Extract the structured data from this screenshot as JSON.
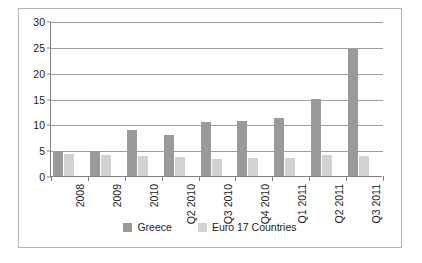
{
  "chart_data": {
    "type": "bar",
    "title": "",
    "xlabel": "",
    "ylabel": "",
    "ylim": [
      0,
      30
    ],
    "yticks": [
      0,
      5,
      10,
      15,
      20,
      25,
      30
    ],
    "grid": true,
    "legend_position": "bottom",
    "categories": [
      "2008",
      "2009",
      "2010",
      "Q2 2010",
      "Q3 2010",
      "Q4 2010",
      "Q1 2011",
      "Q2 2011",
      "Q3 2011"
    ],
    "series": [
      {
        "name": "Greece",
        "color": "#9a9a9a",
        "values": [
          4.8,
          4.9,
          9.0,
          8.0,
          10.5,
          10.6,
          11.3,
          15.0,
          24.5
        ]
      },
      {
        "name": "Euro 17 Countries",
        "color": "#d2d2d2",
        "values": [
          4.3,
          4.0,
          3.9,
          3.6,
          3.3,
          3.4,
          3.5,
          4.1,
          3.9
        ]
      }
    ]
  },
  "legend": {
    "items": [
      {
        "label": "Greece",
        "color": "#9a9a9a"
      },
      {
        "label": "Euro 17 Countries",
        "color": "#d2d2d2"
      }
    ]
  }
}
